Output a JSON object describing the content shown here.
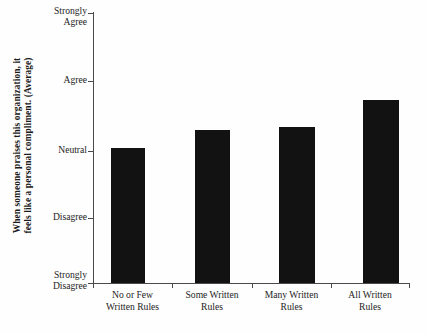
{
  "chart_data": {
    "type": "bar",
    "title": "",
    "subtitle": "",
    "xlabel": "",
    "ylabel_line1": "When someone praises this organization, it",
    "ylabel_line2": "feels like a personal compliment. (Average)",
    "categories": [
      {
        "line1": "No or Few",
        "line2": "Written Rules"
      },
      {
        "line1": "Some Written",
        "line2": "Rules"
      },
      {
        "line1": "Many Written",
        "line2": "Rules"
      },
      {
        "line1": "All Written",
        "line2": "Rules"
      }
    ],
    "values": [
      3.0,
      3.26,
      3.31,
      3.7
    ],
    "ylim": [
      1,
      5
    ],
    "yticks": [
      {
        "value": 5,
        "line1": "Strongly",
        "line2": "Agree"
      },
      {
        "value": 4,
        "line1": "Agree",
        "line2": ""
      },
      {
        "value": 3,
        "line1": "Neutral",
        "line2": ""
      },
      {
        "value": 2,
        "line1": "Disagree",
        "line2": ""
      },
      {
        "value": 1,
        "line1": "Strongly",
        "line2": "Disagree"
      }
    ],
    "grid": false,
    "legend": "none",
    "bar_color": "#121212",
    "axis_color": "#4a4a4a",
    "background_color": "#fefefe"
  }
}
